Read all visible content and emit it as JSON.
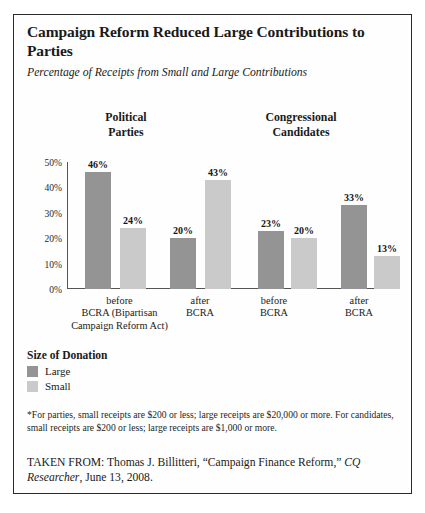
{
  "title": "Campaign Reform Reduced Large Contributions to Parties",
  "subtitle": "Percentage of Receipts from Small and Large Contributions",
  "groups": [
    {
      "line1": "Political",
      "line2": "Parties"
    },
    {
      "line1": "Congressional",
      "line2": "Candidates"
    }
  ],
  "x_labels": [
    "before\nBCRA (Bipartisan\nCampaign Reform Act)",
    "after\nBCRA",
    "before\nBCRA",
    "after\nBCRA"
  ],
  "legend": {
    "title": "Size of Donation",
    "items": [
      {
        "label": "Large",
        "color": "#949494"
      },
      {
        "label": "Small",
        "color": "#cacaca"
      }
    ]
  },
  "footnote": "*For parties, small receipts are $200 or less; large receipts are $20,000 or more. For candidates, small receipts are $200 or less; large receipts are $1,000 or more.",
  "source": {
    "prefix": "TAKEN FROM: Thomas J. Billitteri, “Campaign Finance Reform,” ",
    "italic": "CQ Researcher",
    "suffix": ", June 13, 2008."
  },
  "chart_data": {
    "type": "bar",
    "title": "Campaign Reform Reduced Large Contributions to Parties",
    "subtitle": "Percentage of Receipts from Small and Large Contributions",
    "xlabel": "",
    "ylabel": "",
    "ylim": [
      0,
      50
    ],
    "ytick_labels": [
      "0%",
      "10%",
      "20%",
      "30%",
      "40%",
      "50%"
    ],
    "ytick_values": [
      0,
      10,
      20,
      30,
      40,
      50
    ],
    "grid": false,
    "legend_position": "below-plot-left",
    "categories": [
      "Political Parties — before BCRA",
      "Political Parties — after BCRA",
      "Congressional Candidates — before BCRA",
      "Congressional Candidates — after BCRA"
    ],
    "series": [
      {
        "name": "Large",
        "color": "#949494",
        "values": [
          46,
          20,
          23,
          33
        ]
      },
      {
        "name": "Small",
        "color": "#cacaca",
        "values": [
          24,
          43,
          20,
          13
        ]
      }
    ],
    "value_labels": [
      "46%",
      "24%",
      "20%",
      "43%",
      "23%",
      "20%",
      "33%",
      "13%"
    ],
    "bars": [
      {
        "group": 0,
        "series": "Large",
        "value": 46,
        "label": "46%"
      },
      {
        "group": 0,
        "series": "Small",
        "value": 24,
        "label": "24%"
      },
      {
        "group": 1,
        "series": "Large",
        "value": 20,
        "label": "20%"
      },
      {
        "group": 1,
        "series": "Small",
        "value": 43,
        "label": "43%"
      },
      {
        "group": 2,
        "series": "Large",
        "value": 23,
        "label": "23%"
      },
      {
        "group": 2,
        "series": "Small",
        "value": 20,
        "label": "20%"
      },
      {
        "group": 3,
        "series": "Large",
        "value": 33,
        "label": "33%"
      },
      {
        "group": 3,
        "series": "Small",
        "value": 13,
        "label": "13%"
      }
    ]
  }
}
